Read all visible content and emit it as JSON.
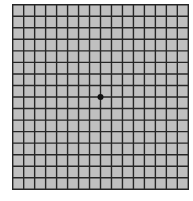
{
  "figure": {
    "type": "amsler-grid",
    "columns": 16,
    "rows": 16,
    "fixation_point": {
      "col": 8,
      "row": 8
    },
    "colors": {
      "background": "#ffffff",
      "cell_fill": "#c0c0c0",
      "grid_line": "#262626",
      "fixation_dot": "#111111"
    },
    "geometry": {
      "left": 12,
      "top": 4,
      "width": 177,
      "height": 186,
      "line_width": 1.4,
      "dot_radius": 3
    }
  }
}
